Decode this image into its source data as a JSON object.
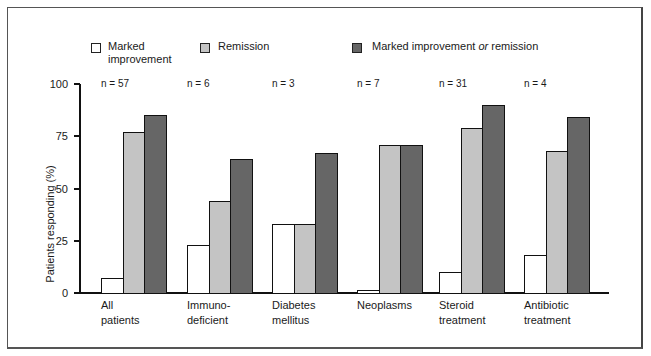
{
  "chart_data": {
    "type": "bar",
    "title": "",
    "xlabel": "",
    "ylabel": "Patients responding (%)",
    "ylim": [
      0,
      100
    ],
    "yticks": [
      0,
      25,
      50,
      75,
      100
    ],
    "grid": false,
    "legend_position": "top",
    "categories": [
      "All patients",
      "Immuno-deficient",
      "Diabetes mellitus",
      "Neoplasms",
      "Steroid treatment",
      "Antibiotic treatment"
    ],
    "category_lines": [
      [
        "All",
        "patients"
      ],
      [
        "Immuno-",
        "deficient"
      ],
      [
        "Diabetes",
        "mellitus"
      ],
      [
        "Neoplasms",
        ""
      ],
      [
        "Steroid",
        "treatment"
      ],
      [
        "Antibiotic",
        "treatment"
      ]
    ],
    "n_labels": [
      "n = 57",
      "n = 6",
      "n = 3",
      "n = 7",
      "n = 31",
      "n = 4"
    ],
    "series": [
      {
        "name": "Marked improvement",
        "color": "#ffffff",
        "values": [
          7,
          23,
          33,
          1.5,
          10,
          18
        ]
      },
      {
        "name": "Remission",
        "color": "#c4c4c4",
        "values": [
          77,
          44,
          33,
          71,
          79,
          68
        ]
      },
      {
        "name": "Marked improvement or remission",
        "color": "#666666",
        "values": [
          85,
          64,
          67,
          71,
          90,
          84
        ]
      }
    ]
  },
  "legend": {
    "items": [
      {
        "line1": "Marked",
        "line2": "improvement"
      },
      {
        "line1": "Remission"
      },
      {
        "pre": "Marked improvement ",
        "em": "or",
        "post": " remission"
      }
    ]
  }
}
